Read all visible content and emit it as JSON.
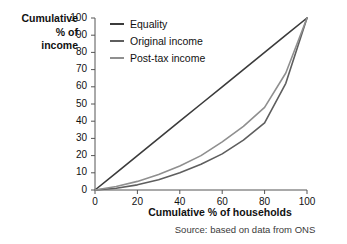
{
  "chart_data": {
    "type": "line",
    "title": "",
    "xlabel": "Cumulative % of households",
    "ylabel": "Cumulative % of income",
    "source": "Source: based on data from ONS",
    "xlim": [
      0,
      100
    ],
    "ylim": [
      0,
      100
    ],
    "grid": false,
    "legend_position": "top-left",
    "xticks": [
      0,
      20,
      40,
      60,
      80,
      100
    ],
    "yticks": [
      0,
      10,
      20,
      30,
      40,
      50,
      60,
      70,
      80,
      90,
      100
    ],
    "xtick_labels": [
      "0",
      "20",
      "40",
      "60",
      "80",
      "100"
    ],
    "ytick_labels": [
      "0",
      "10",
      "20",
      "30",
      "40",
      "50",
      "60",
      "70",
      "80",
      "90",
      "100"
    ],
    "x": [
      0,
      10,
      20,
      30,
      40,
      50,
      60,
      70,
      80,
      90,
      100
    ],
    "series": [
      {
        "name": "Equality",
        "color": "#3b3b3b",
        "values": [
          0,
          10,
          20,
          30,
          40,
          50,
          60,
          70,
          80,
          90,
          100
        ]
      },
      {
        "name": "Original income",
        "color": "#5e5e5e",
        "values": [
          0,
          1,
          3,
          6,
          10,
          15,
          21,
          29,
          39,
          62,
          100
        ]
      },
      {
        "name": "Post-tax income",
        "color": "#8f8f8f",
        "values": [
          0,
          2,
          5,
          9,
          14,
          20,
          28,
          37,
          48,
          68,
          100
        ]
      }
    ]
  },
  "axis": {
    "ylabel_lines": [
      "Cumulative",
      "% of",
      "income"
    ]
  },
  "legend": {
    "items": [
      {
        "label": "Equality",
        "color": "#3b3b3b"
      },
      {
        "label": "Original income",
        "color": "#5e5e5e"
      },
      {
        "label": "Post-tax income",
        "color": "#8f8f8f"
      }
    ]
  }
}
